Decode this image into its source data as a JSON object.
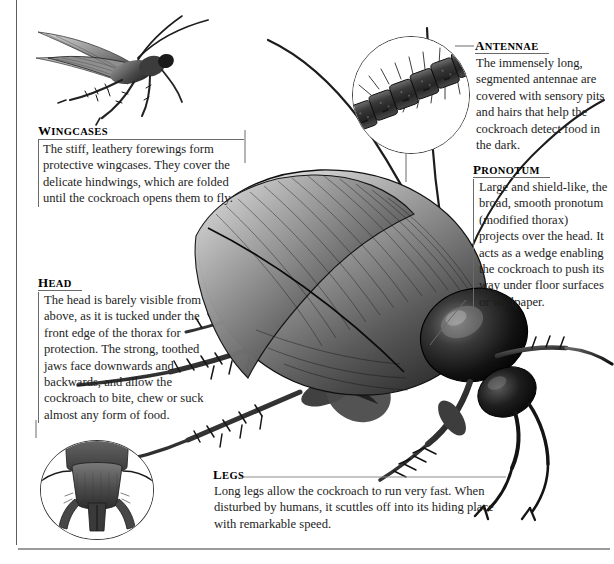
{
  "page": {
    "background_color": "#ffffff",
    "text_color": "#1d1d1d",
    "rule_color": "#6a6a6a",
    "width": 614,
    "height": 564
  },
  "callouts": [
    {
      "id": "wingcases",
      "heading": "Wingcases",
      "body": "The stiff, leathery forewings form protective wingcases. They cover the delicate hindwings, which are folded until the cockroach opens them to fly."
    },
    {
      "id": "antennae",
      "heading": "Antennae",
      "body": "The immensely long, segmented antennae are covered with sensory pits and hairs that help the cockroach detect food in the dark."
    },
    {
      "id": "pronotum",
      "heading": "Pronotum",
      "body": "Large and shield-like, the broad, smooth pronotum (modified thorax) projects over the head. It acts as a wedge enabling the cockroach to push its way under floor surfaces or wallpaper."
    },
    {
      "id": "head",
      "heading": "Head",
      "body": "The head is barely visible from above, as it is tucked under the front edge of the thorax for protection. The strong, toothed jaws face downwards and backwards, and allow the cockroach to bite, chew or suck almost any form of food."
    },
    {
      "id": "legs",
      "heading": "Legs",
      "body": "Long legs allow the cockroach to run very fast. When disturbed by humans, it scuttles off into its hiding place with remarkable speed."
    }
  ],
  "illustrations": [
    {
      "id": "flying-cockroach",
      "label": "flying cockroach illustration"
    },
    {
      "id": "main-cockroach",
      "label": "main cockroach body illustration"
    },
    {
      "id": "antenna-detail",
      "label": "antenna segment close-up inset"
    },
    {
      "id": "head-detail",
      "label": "head underside close-up inset"
    }
  ]
}
